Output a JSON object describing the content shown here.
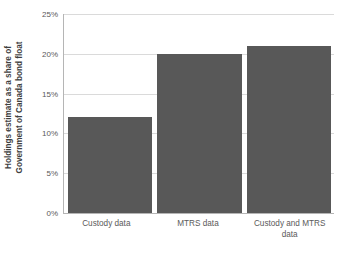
{
  "chart_data": {
    "type": "bar",
    "title": "",
    "xlabel": "",
    "ylabel": "Holdings estimate as a share of Government of Canada bond float",
    "ylabel_lines": [
      "Holdings estimate as a share of",
      "Government of Canada bond float"
    ],
    "categories": [
      "Custody data",
      "MTRS data",
      "Custody and MTRS data"
    ],
    "category_lines": [
      [
        "Custody data"
      ],
      [
        "MTRS data"
      ],
      [
        "Custody and MTRS",
        "data"
      ]
    ],
    "values": [
      12,
      20,
      21
    ],
    "value_labels": [
      "12%",
      "20%",
      "21%"
    ],
    "ylim": [
      0,
      25
    ],
    "ytick_values": [
      0,
      5,
      10,
      15,
      20,
      25
    ],
    "ytick_labels": [
      "0%",
      "5%",
      "10%",
      "15%",
      "20%",
      "25%"
    ],
    "grid": true,
    "grid_axis": "y",
    "legend": false,
    "legend_position": "none",
    "bar_color": "#585858",
    "grid_color": "#dadada",
    "axis_color": "#b5b5b5",
    "background_color": "#ffffff"
  }
}
